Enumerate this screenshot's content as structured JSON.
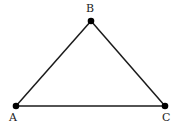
{
  "diagram": {
    "type": "triangle",
    "points": [
      {
        "label": "A",
        "x": 16,
        "y": 106
      },
      {
        "label": "B",
        "x": 91,
        "y": 21
      },
      {
        "label": "C",
        "x": 165,
        "y": 106
      }
    ],
    "edges": [
      [
        "A",
        "B"
      ],
      [
        "B",
        "C"
      ],
      [
        "C",
        "A"
      ]
    ],
    "stroke_color": "#1a1a1a",
    "point_color": "#000000"
  }
}
